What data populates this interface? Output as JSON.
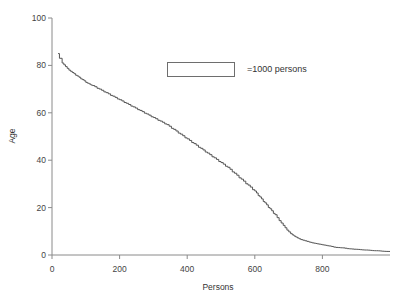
{
  "chart_data": {
    "type": "line",
    "title": "",
    "xlabel": "Persons",
    "ylabel": "Age",
    "xlim": [
      0,
      1000
    ],
    "ylim": [
      0,
      100
    ],
    "xticks": [
      0,
      200,
      400,
      600,
      800
    ],
    "yticks": [
      0,
      20,
      40,
      60,
      80,
      100
    ],
    "xtick_labels": [
      "0",
      "200",
      "400",
      "600",
      "800"
    ],
    "ytick_labels": [
      "0",
      "20",
      "40",
      "60",
      "80",
      "100"
    ],
    "grid": false,
    "legend_position": "inside-top-center",
    "legend_entries": [
      {
        "label": "=1000 persons",
        "swatch": "empty-rectangle"
      }
    ],
    "series": [
      {
        "name": "age-by-persons",
        "style": "step",
        "color": "#555555",
        "x": [
          18,
          22,
          30,
          40,
          50,
          60,
          75,
          90,
          105,
          120,
          140,
          160,
          180,
          200,
          220,
          240,
          260,
          280,
          300,
          320,
          340,
          360,
          380,
          400,
          420,
          440,
          460,
          480,
          500,
          520,
          540,
          560,
          580,
          600,
          615,
          630,
          645,
          660,
          672,
          684,
          695,
          706,
          716,
          726,
          736,
          748,
          760,
          775,
          790,
          805,
          820,
          840,
          860,
          880,
          900,
          930,
          960,
          1000
        ],
        "y": [
          85,
          83,
          81,
          79.5,
          78,
          77,
          75.5,
          74,
          72.5,
          71.5,
          70,
          68.5,
          67,
          65.5,
          64,
          62.5,
          61,
          59.5,
          58,
          56.5,
          55,
          53,
          51,
          49,
          47,
          45,
          43,
          41,
          39,
          37,
          34.5,
          32,
          29.5,
          27,
          24.5,
          22,
          19.5,
          17,
          14.5,
          12.5,
          10.5,
          9,
          8,
          7.2,
          6.5,
          6,
          5.5,
          5,
          4.6,
          4.2,
          3.8,
          3.2,
          3,
          2.6,
          2.4,
          2.1,
          1.8,
          1.5
        ]
      }
    ]
  },
  "axis": {
    "y_title": "Age",
    "x_title": "Persons"
  },
  "legend": {
    "text": "=1000 persons"
  }
}
